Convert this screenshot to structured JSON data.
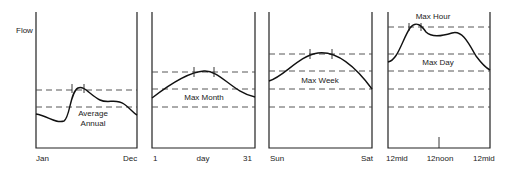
{
  "diagram": {
    "y_axis_label": "Flow",
    "panels": [
      {
        "id": "annual",
        "x_labels": [
          "Jan",
          "Dec"
        ],
        "annotations": [
          "Average",
          "Annual"
        ]
      },
      {
        "id": "month",
        "x_labels": [
          "1",
          "day",
          "31"
        ],
        "annotations": [
          "Max Month"
        ]
      },
      {
        "id": "week",
        "x_labels": [
          "Sun",
          "Sat"
        ],
        "annotations": [
          "Max Week"
        ]
      },
      {
        "id": "day",
        "x_labels": [
          "12mid",
          "12noon",
          "12mid"
        ],
        "annotations": [
          "Max Hour",
          "Max Day"
        ]
      }
    ]
  }
}
